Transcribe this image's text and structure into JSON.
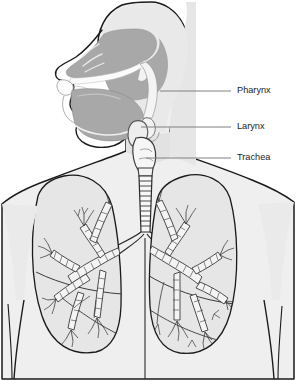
{
  "figure": {
    "view": "anterior torso with mid-sagittal head section",
    "background_color": "#ffffff"
  },
  "palette": {
    "background": "#ffffff",
    "body_fill": "#efefef",
    "body_shade": "#e2e2e2",
    "cavity_gray": "#a8a8a8",
    "cavity_gray_light": "#c4c4c4",
    "lung_fill": "#e6e6e6",
    "lung_inner": "#dcdcdc",
    "airway_fill": "#f7f7f7",
    "outline_dark": "#1a1a1a",
    "outline_mid": "#555555",
    "outline_light": "#8a8a8a",
    "leader_line": "#808080",
    "label_text": "#1a1a1a"
  },
  "labels": [
    {
      "id": "pharynx",
      "text": "Pharynx",
      "text_x": 237,
      "text_y": 91,
      "leader_x1": 160,
      "leader_x2": 231,
      "leader_y": 91
    },
    {
      "id": "larynx",
      "text": "Larynx",
      "text_x": 237,
      "text_y": 127,
      "leader_x1": 141,
      "leader_x2": 231,
      "leader_y": 127
    },
    {
      "id": "trachea",
      "text": "Trachea",
      "text_x": 237,
      "text_y": 158,
      "leader_x1": 146,
      "leader_x2": 231,
      "leader_y": 158
    }
  ],
  "structures": {
    "head": "head in left-facing profile, mid-sagittal section",
    "nasal_cavity": "nasal cavity",
    "oral_cavity": "oral cavity with tongue, teeth and lips",
    "soft_palate": "soft palate",
    "pharynx_cavity": "pharyngeal air space",
    "epiglottis": "epiglottis",
    "hyoid": "hyoid bone",
    "thyroid_cartilage": "thyroid cartilage",
    "trachea": "trachea with cartilage rings",
    "carina": "tracheal bifurcation",
    "left_lung": "left lung",
    "right_lung": "right lung",
    "bronchial_tree_left": "left bronchial tree",
    "bronchial_tree_right": "right bronchial tree",
    "torso": "torso with shoulders and arms",
    "sternum_line": "midline of sternum"
  }
}
